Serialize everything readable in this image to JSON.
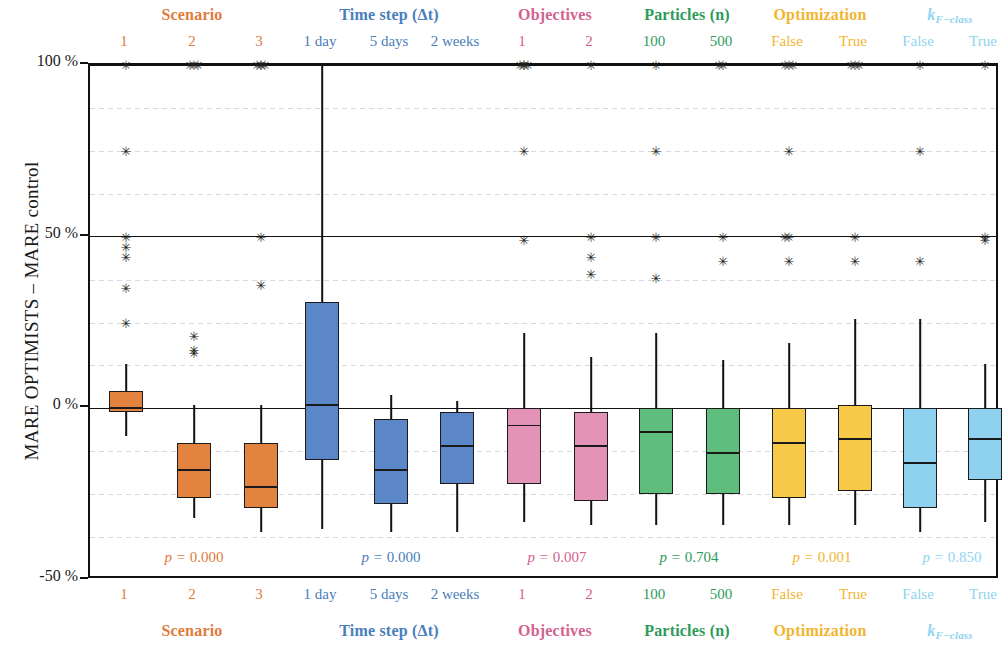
{
  "axis": {
    "ylabel": "MARE OPTIMISTS – MARE control",
    "yticks": [
      "100 %",
      "50 %",
      "0 %",
      "-50 %"
    ],
    "ytick_values": [
      100,
      50,
      0,
      -50
    ],
    "ylim": [
      -50,
      100
    ]
  },
  "groups": [
    {
      "name": "Scenario",
      "title": "Scenario",
      "color": "#E07B39",
      "fill": "#E2843F",
      "pvalue": "p = 0.000",
      "levels": [
        "1",
        "2",
        "3"
      ]
    },
    {
      "name": "Time step",
      "title": "Time step (Δt)",
      "color": "#4A7EBB",
      "fill": "#5B87C8",
      "pvalue": "p = 0.000",
      "levels": [
        "1 day",
        "5 days",
        "2 weeks"
      ]
    },
    {
      "name": "Objectives",
      "title": "Objectives",
      "color": "#D4618E",
      "fill": "#E293B6",
      "pvalue": "p = 0.007",
      "levels": [
        "1",
        "2"
      ]
    },
    {
      "name": "Particles",
      "title": "Particles (n)",
      "color": "#2E9B5B",
      "fill": "#5FBE7E",
      "pvalue": "p = 0.704",
      "levels": [
        "100",
        "500"
      ]
    },
    {
      "name": "Optimization",
      "title": "Optimization",
      "color": "#F2B531",
      "fill": "#F7C948",
      "pvalue": "p = 0.001",
      "levels": [
        "False",
        "True"
      ]
    },
    {
      "name": "kFclass",
      "title": "k_{F-class}",
      "title_html": "k<sub>F−class</sub>",
      "color": "#8FD4F0",
      "fill": "#8FD2F0",
      "pvalue": "p = 0.850",
      "levels": [
        "False",
        "True"
      ]
    }
  ],
  "chart_data": {
    "type": "box",
    "title": "",
    "xlabel": "",
    "ylabel": "MARE OPTIMISTS – MARE control",
    "ylim": [
      -50,
      100
    ],
    "yticks": [
      -50,
      0,
      50,
      100
    ],
    "ytick_labels": [
      "-50 %",
      "0 %",
      "50 %",
      "100 %"
    ],
    "grid": true,
    "legend": "none",
    "units": "percent",
    "boxes": [
      {
        "group": "Scenario",
        "level": "1",
        "color": "#E2843F",
        "whisker_low": -8,
        "q1": -1,
        "median": 0,
        "q3": 5,
        "whisker_high": 13,
        "outliers": [
          100,
          75,
          50,
          47,
          44,
          35,
          25
        ]
      },
      {
        "group": "Scenario",
        "level": "2",
        "color": "#E2843F",
        "whisker_low": -32,
        "q1": -26,
        "median": -18,
        "q3": -10,
        "whisker_high": 1,
        "outliers": [
          100,
          100,
          100,
          21,
          17,
          16
        ]
      },
      {
        "group": "Scenario",
        "level": "3",
        "color": "#E2843F",
        "whisker_low": -36,
        "q1": -29,
        "median": -23,
        "q3": -10,
        "whisker_high": 1,
        "outliers": [
          100,
          100,
          100,
          100,
          50,
          36
        ]
      },
      {
        "group": "Time step",
        "level": "1 day",
        "color": "#5B87C8",
        "whisker_low": -35,
        "q1": -15,
        "median": 1,
        "q3": 31,
        "whisker_high": 100,
        "outliers": []
      },
      {
        "group": "Time step",
        "level": "5 days",
        "color": "#5B87C8",
        "whisker_low": -36,
        "q1": -28,
        "median": -18,
        "q3": -3,
        "whisker_high": 4,
        "outliers": []
      },
      {
        "group": "Time step",
        "level": "2 weeks",
        "color": "#5B87C8",
        "whisker_low": -36,
        "q1": -22,
        "median": -11,
        "q3": -1,
        "whisker_high": 2,
        "outliers": []
      },
      {
        "group": "Objectives",
        "level": "1",
        "color": "#E293B6",
        "whisker_low": -33,
        "q1": -22,
        "median": -5,
        "q3": 0,
        "whisker_high": 22,
        "outliers": [
          100,
          100,
          100,
          100,
          75,
          49
        ]
      },
      {
        "group": "Objectives",
        "level": "2",
        "color": "#E293B6",
        "whisker_low": -34,
        "q1": -27,
        "median": -11,
        "q3": -1,
        "whisker_high": 15,
        "outliers": [
          100,
          50,
          44,
          39
        ]
      },
      {
        "group": "Particles",
        "level": "100",
        "color": "#5FBE7E",
        "whisker_low": -34,
        "q1": -25,
        "median": -7,
        "q3": 0,
        "whisker_high": 22,
        "outliers": [
          100,
          75,
          50,
          38
        ]
      },
      {
        "group": "Particles",
        "level": "500",
        "color": "#5FBE7E",
        "whisker_low": -34,
        "q1": -25,
        "median": -13,
        "q3": 0,
        "whisker_high": 14,
        "outliers": [
          100,
          100,
          50,
          43
        ]
      },
      {
        "group": "Optimization",
        "level": "False",
        "color": "#F7C948",
        "whisker_low": -34,
        "q1": -26,
        "median": -10,
        "q3": 0,
        "whisker_high": 19,
        "outliers": [
          100,
          100,
          100,
          75,
          50,
          50,
          43
        ]
      },
      {
        "group": "Optimization",
        "level": "True",
        "color": "#F7C948",
        "whisker_low": -34,
        "q1": -24,
        "median": -9,
        "q3": 1,
        "whisker_high": 26,
        "outliers": [
          100,
          100,
          100,
          50,
          43
        ]
      },
      {
        "group": "kFclass",
        "level": "False",
        "color": "#8FD2F0",
        "whisker_low": -36,
        "q1": -29,
        "median": -16,
        "q3": 0,
        "whisker_high": 26,
        "outliers": [
          100,
          75,
          43
        ]
      },
      {
        "group": "kFclass",
        "level": "True",
        "color": "#8FD2F0",
        "whisker_low": -33,
        "q1": -21,
        "median": -9,
        "q3": 0,
        "whisker_high": 13,
        "outliers": [
          100,
          50,
          49
        ]
      }
    ],
    "pvalues": [
      {
        "group": "Scenario",
        "text": "p = 0.000",
        "value": 0.0,
        "color": "#E07B39"
      },
      {
        "group": "Time step",
        "text": "p = 0.000",
        "value": 0.0,
        "color": "#4A7EBB"
      },
      {
        "group": "Objectives",
        "text": "p = 0.007",
        "value": 0.007,
        "color": "#D4618E"
      },
      {
        "group": "Particles",
        "text": "p = 0.704",
        "value": 0.704,
        "color": "#2E9B5B"
      },
      {
        "group": "Optimization",
        "text": "p = 0.001",
        "value": 0.001,
        "color": "#F2B531"
      },
      {
        "group": "kFclass",
        "text": "p = 0.850",
        "value": 0.85,
        "color": "#8FD4F0"
      }
    ]
  }
}
